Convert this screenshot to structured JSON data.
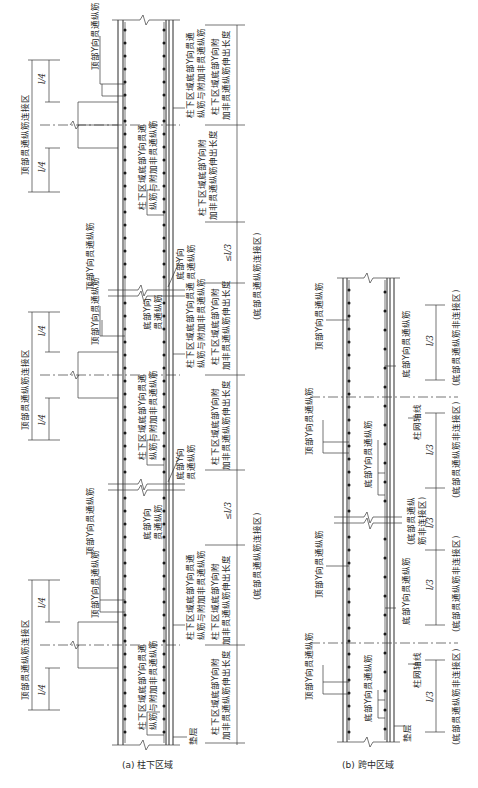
{
  "figure": {
    "orientation": "rotated 90deg counter-clockwise",
    "panel_a": {
      "caption": "(a) 柱下区域",
      "labels": {
        "top_splice_zone": "顶部贯通纵筋连接区",
        "top_bar": "顶部Y向贯通纵筋",
        "bottom_bar": "底部Y向贯通纵筋",
        "bottom_bar_with_extra": "柱下区域底部Y向贯通纵筋与附加非贯通纵筋",
        "bottom_bar_with_extra_l1": "柱下区域底部Y向贯通",
        "bottom_bar_with_extra_l2": "纵筋与附加非贯通纵筋",
        "extension_l1": "柱下区域底部Y向附",
        "extension_l2": "加非贯通纵筋伸出长度",
        "bottom_splice_zone": "(底部贯通纵筋连接区)",
        "bottom_bar_l1": "底部Y向",
        "bottom_bar_l2": "贯通纵筋",
        "cushion": "垫层",
        "dim_quarter": "l/4",
        "dim_third_max": "≤l/3"
      }
    },
    "panel_b": {
      "caption": "(b) 跨中区域",
      "labels": {
        "top_bar": "顶部Y向贯通纵筋",
        "bottom_bar": "底部Y向贯通纵筋",
        "column_axis": "柱网轴线",
        "cushion": "垫层",
        "dim_third": "l/3",
        "non_splice_zone": "(底部贯通纵筋非连接区)",
        "non_splice_zone_l1": "(底部贯通纵",
        "non_splice_zone_l2": "筋非连接区)"
      }
    },
    "colors": {
      "line": "#2a2a2a",
      "background": "#ffffff"
    }
  }
}
